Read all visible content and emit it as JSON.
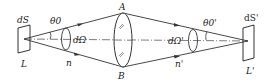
{
  "figure": {
    "type": "optics-diagram",
    "colors": {
      "line": "#333333",
      "background": "#ffffff"
    }
  },
  "labels": {
    "source_area": "dS",
    "source_name": "L",
    "source_angle": "θ0",
    "source_solid_angle": "dΩ",
    "source_index": "n",
    "lens_top": "A",
    "lens_bottom": "B",
    "image_solid_angle": "dΩ'",
    "image_angle": "θ0'",
    "image_index": "n'",
    "image_area": "dS'",
    "image_name": "L'"
  }
}
